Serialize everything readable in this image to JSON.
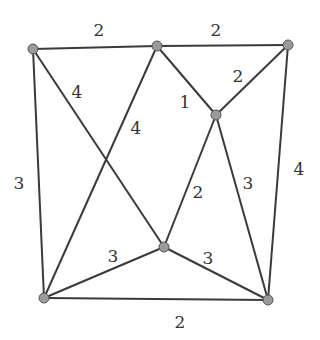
{
  "graph": {
    "nodes": [
      {
        "id": "A",
        "x": 33,
        "y": 49
      },
      {
        "id": "B",
        "x": 157,
        "y": 46
      },
      {
        "id": "C",
        "x": 288,
        "y": 45
      },
      {
        "id": "D",
        "x": 216,
        "y": 115
      },
      {
        "id": "E",
        "x": 164,
        "y": 247
      },
      {
        "id": "F",
        "x": 44,
        "y": 298
      },
      {
        "id": "G",
        "x": 268,
        "y": 300
      }
    ],
    "edges": [
      {
        "from": "A",
        "to": "B",
        "weight": "2",
        "lx": 99,
        "ly": 31
      },
      {
        "from": "B",
        "to": "C",
        "weight": "2",
        "lx": 216,
        "ly": 31
      },
      {
        "from": "C",
        "to": "D",
        "weight": "2",
        "lx": 238,
        "ly": 77
      },
      {
        "from": "B",
        "to": "D",
        "weight": "1",
        "lx": 185,
        "ly": 103
      },
      {
        "from": "A",
        "to": "E",
        "weight": "4",
        "lx": 77,
        "ly": 93
      },
      {
        "from": "B",
        "to": "F",
        "weight": "4",
        "lx": 136,
        "ly": 129
      },
      {
        "from": "A",
        "to": "F",
        "weight": "3",
        "lx": 19,
        "ly": 184
      },
      {
        "from": "C",
        "to": "G",
        "weight": "4",
        "lx": 299,
        "ly": 170
      },
      {
        "from": "D",
        "to": "E",
        "weight": "2",
        "lx": 198,
        "ly": 193
      },
      {
        "from": "D",
        "to": "G",
        "weight": "3",
        "lx": 248,
        "ly": 184
      },
      {
        "from": "E",
        "to": "F",
        "weight": "3",
        "lx": 113,
        "ly": 257
      },
      {
        "from": "E",
        "to": "G",
        "weight": "3",
        "lx": 208,
        "ly": 259
      },
      {
        "from": "F",
        "to": "G",
        "weight": "2",
        "lx": 180,
        "ly": 323
      }
    ]
  }
}
